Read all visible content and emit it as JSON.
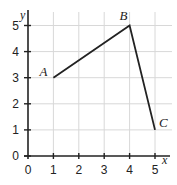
{
  "chart_data": {
    "type": "line",
    "title": "",
    "xlabel": "x",
    "ylabel": "y",
    "xlim": [
      0,
      5
    ],
    "ylim": [
      0,
      5
    ],
    "grid": true,
    "x_ticks": [
      "0",
      "1",
      "2",
      "3",
      "4",
      "5"
    ],
    "y_ticks": [
      "0",
      "1",
      "2",
      "3",
      "4",
      "5"
    ],
    "series": [
      {
        "name": "ABC",
        "points": [
          {
            "label": "A",
            "x": 1,
            "y": 3
          },
          {
            "label": "B",
            "x": 4,
            "y": 5
          },
          {
            "label": "C",
            "x": 5,
            "y": 1
          }
        ]
      }
    ]
  }
}
